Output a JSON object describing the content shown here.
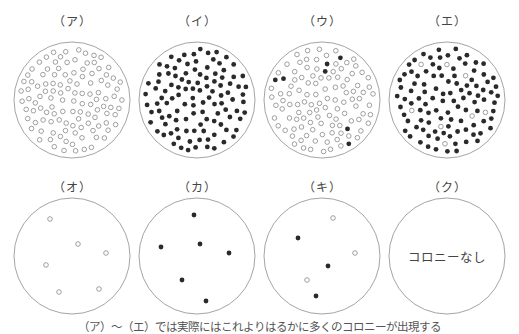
{
  "colors": {
    "dish_outline": "#9a9a9a",
    "white_colony_stroke": "#888888",
    "black_colony_fill": "#2a2a2a"
  },
  "dishes": [
    {
      "label": "（ア）",
      "row": 0,
      "cx": 72,
      "cy": 100,
      "r": 58,
      "type": "many-white"
    },
    {
      "label": "（イ）",
      "row": 0,
      "cx": 197,
      "cy": 100,
      "r": 58,
      "type": "many-black"
    },
    {
      "label": "（ウ）",
      "row": 0,
      "cx": 322,
      "cy": 100,
      "r": 58,
      "type": "many-white-few-black"
    },
    {
      "label": "（エ）",
      "row": 0,
      "cx": 447,
      "cy": 100,
      "r": 58,
      "type": "many-black-few-white"
    },
    {
      "label": "（オ）",
      "row": 1,
      "cx": 72,
      "cy": 256,
      "r": 58,
      "type": "few-white",
      "colonies": [
        {
          "x": 50,
          "y": 219,
          "c": "w"
        },
        {
          "x": 78,
          "y": 244,
          "c": "w"
        },
        {
          "x": 106,
          "y": 253,
          "c": "w"
        },
        {
          "x": 46,
          "y": 265,
          "c": "w"
        },
        {
          "x": 59,
          "y": 292,
          "c": "w"
        },
        {
          "x": 99,
          "y": 289,
          "c": "w"
        }
      ]
    },
    {
      "label": "（カ）",
      "row": 1,
      "cx": 197,
      "cy": 256,
      "r": 58,
      "type": "few-black",
      "colonies": [
        {
          "x": 194,
          "y": 215,
          "c": "b"
        },
        {
          "x": 161,
          "y": 247,
          "c": "b"
        },
        {
          "x": 200,
          "y": 244,
          "c": "b"
        },
        {
          "x": 229,
          "y": 253,
          "c": "b"
        },
        {
          "x": 182,
          "y": 280,
          "c": "b"
        },
        {
          "x": 206,
          "y": 301,
          "c": "b"
        }
      ]
    },
    {
      "label": "（キ）",
      "row": 1,
      "cx": 322,
      "cy": 256,
      "r": 58,
      "type": "few-mixed",
      "colonies": [
        {
          "x": 333,
          "y": 218,
          "c": "w"
        },
        {
          "x": 298,
          "y": 238,
          "c": "b"
        },
        {
          "x": 355,
          "y": 253,
          "c": "w"
        },
        {
          "x": 328,
          "y": 266,
          "c": "b"
        },
        {
          "x": 307,
          "y": 280,
          "c": "w"
        },
        {
          "x": 316,
          "y": 296,
          "c": "b"
        }
      ]
    },
    {
      "label": "（ク）",
      "row": 1,
      "cx": 447,
      "cy": 256,
      "r": 58,
      "type": "none",
      "center_text": "コロニーなし"
    }
  ],
  "caption": "（ア）～（エ）では実際にはこれよりはるかに多くのコロニーが出現する"
}
